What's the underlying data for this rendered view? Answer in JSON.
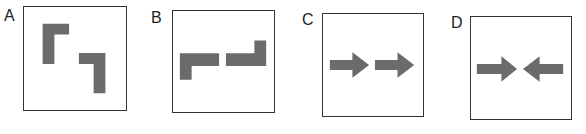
{
  "figure": {
    "shape_color": "#6b6b6b",
    "border_color": "#333333",
    "panels": [
      {
        "label": "A",
        "description": "two L-shaped corner brackets offset diagonally (top-left and bottom-right corners)"
      },
      {
        "label": "B",
        "description": "two L-shaped brackets side by side forming a horizontal line with ends bent down (left) and up (right)"
      },
      {
        "label": "C",
        "description": "two right-pointing arrows in a row"
      },
      {
        "label": "D",
        "description": "two arrows pointing toward each other"
      }
    ]
  }
}
